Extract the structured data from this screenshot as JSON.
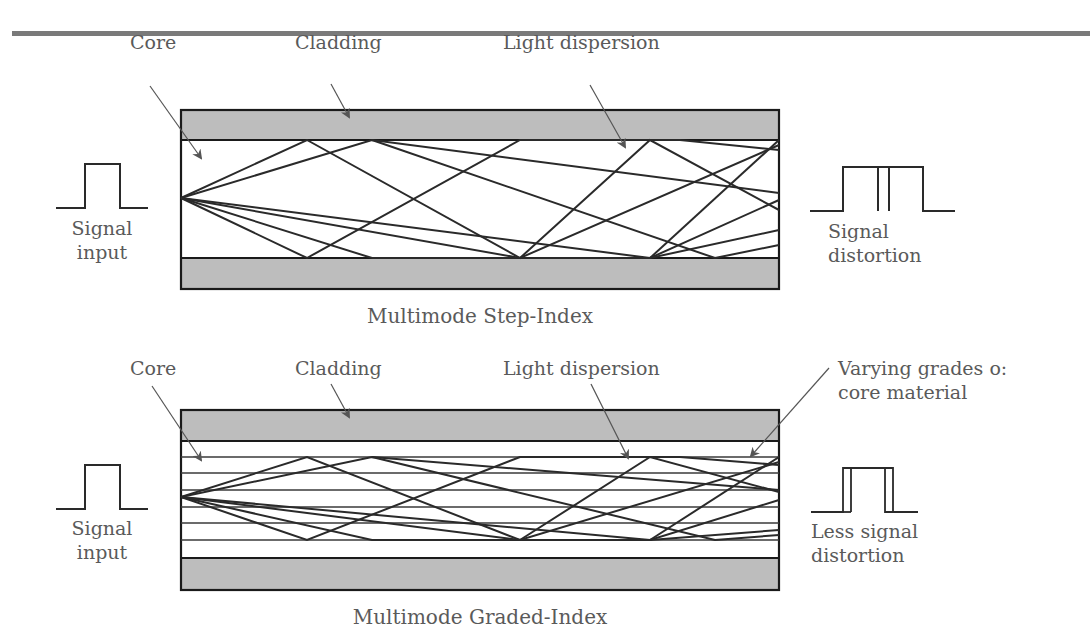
{
  "colors": {
    "rule": "#7a7a7a",
    "cladding_fill": "#bdbdbd",
    "outline": "#1a1a1a",
    "ray": "#2a2a2a",
    "arrow": "#555555",
    "label_text": "#5a5a5a",
    "grade_line": "#3a3a3a"
  },
  "diagrams": [
    {
      "id": "step-index",
      "caption": "Multimode Step-Index",
      "labels": {
        "core": "Core",
        "cladding": "Cladding",
        "light_dispersion": "Light dispersion"
      },
      "input": {
        "line1": "Signal",
        "line2": "input"
      },
      "output": {
        "line1": "Signal",
        "line2": "distortion"
      },
      "output_pulse": "two separated pulses"
    },
    {
      "id": "graded-index",
      "caption": "Multimode Graded-Index",
      "labels": {
        "core": "Core",
        "cladding": "Cladding",
        "light_dispersion": "Light dispersion",
        "varying_grades_line1": "Varying grades o:",
        "varying_grades_line2": "core material"
      },
      "input": {
        "line1": "Signal",
        "line2": "input"
      },
      "output": {
        "line1": "Less signal",
        "line2": "distortion"
      },
      "output_pulse": "slightly broadened single pulse"
    }
  ]
}
